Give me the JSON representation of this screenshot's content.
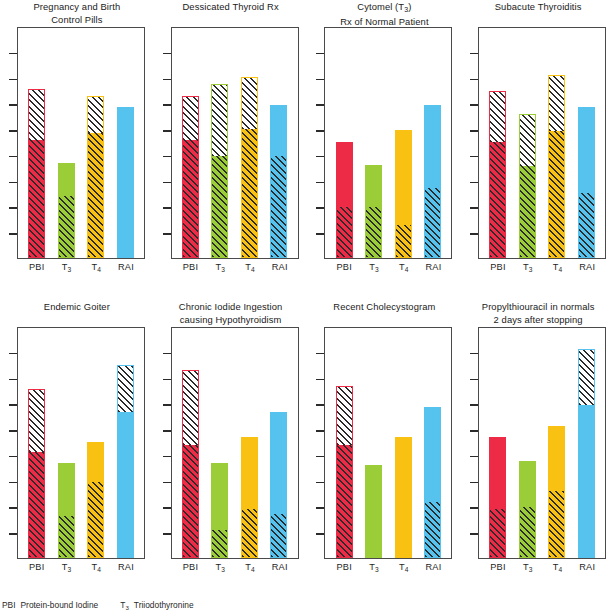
{
  "figure": {
    "axis": {
      "tick_count": 8,
      "categories": [
        "PBI",
        "T3",
        "T4",
        "RAI"
      ],
      "category_labels_html": [
        "PBI",
        "T<sub>3</sub>",
        "T<sub>4</sub>",
        "RAI"
      ]
    },
    "colors": {
      "pbi": "#ee2b46",
      "t3": "#9acd38",
      "t4": "#f9c212",
      "rai": "#56c3ee",
      "frame": "#4a4a4a",
      "hatch": "#2b2b2b",
      "title": "#1a1a1a"
    },
    "legend": [
      {
        "abbr": "PBI",
        "abbr_html": "PBI",
        "text": "Protein-bound Iodine"
      },
      {
        "abbr": "T3",
        "abbr_html": "T<sub>3</sub>",
        "text": "Triiodothyronine"
      }
    ]
  },
  "chart_data": {
    "type": "bar",
    "xlabel": "",
    "ylabel": "",
    "grid": false,
    "legend_position": "bottom",
    "categories": [
      "PBI",
      "T3",
      "T4",
      "RAI"
    ],
    "ylim": [
      0,
      100
    ],
    "panels": [
      {
        "id": "pregnancy-and-birth-control-pills",
        "title_lines": [
          "Pregnancy and Birth",
          "Control Pills"
        ],
        "bars": [
          {
            "category": "PBI",
            "color": "#ee2b46",
            "total": 73,
            "solid_top": 51,
            "hatch_from": 51
          },
          {
            "category": "T3",
            "color": "#9acd38",
            "total": 41,
            "solid_top": 41,
            "hatch_from": 27
          },
          {
            "category": "T4",
            "color": "#f9c212",
            "total": 70,
            "solid_top": 54,
            "hatch_from": 54
          },
          {
            "category": "RAI",
            "color": "#56c3ee",
            "total": 65,
            "solid_top": 65,
            "hatch_from": 0
          }
        ]
      },
      {
        "id": "dessicated-thyroid-rx",
        "title_lines": [
          "Dessicated Thyroid Rx"
        ],
        "bars": [
          {
            "category": "PBI",
            "color": "#ee2b46",
            "total": 70,
            "solid_top": 51,
            "hatch_from": 51
          },
          {
            "category": "T3",
            "color": "#9acd38",
            "total": 75,
            "solid_top": 44,
            "hatch_from": 44
          },
          {
            "category": "T4",
            "color": "#f9c212",
            "total": 78,
            "solid_top": 56,
            "hatch_from": 56
          },
          {
            "category": "RAI",
            "color": "#56c3ee",
            "total": 66,
            "solid_top": 66,
            "hatch_from": 44
          }
        ]
      },
      {
        "id": "cytomel-t3-rx-of-normal-patient",
        "title_lines": [
          "Cytomel (T3)",
          "Rx of Normal Patient"
        ],
        "title_html": [
          "Cytomel (T<sub>3</sub>)",
          "Rx of Normal Patient"
        ],
        "bars": [
          {
            "category": "PBI",
            "color": "#ee2b46",
            "total": 50,
            "solid_top": 50,
            "hatch_from": 22
          },
          {
            "category": "T3",
            "color": "#9acd38",
            "total": 40,
            "solid_top": 40,
            "hatch_from": 22
          },
          {
            "category": "T4",
            "color": "#f9c212",
            "total": 55,
            "solid_top": 55,
            "hatch_from": 14
          },
          {
            "category": "RAI",
            "color": "#56c3ee",
            "total": 66,
            "solid_top": 66,
            "hatch_from": 30
          }
        ]
      },
      {
        "id": "subacute-thyroiditis",
        "title_lines": [
          "Subacute Thyroiditis"
        ],
        "bars": [
          {
            "category": "PBI",
            "color": "#ee2b46",
            "total": 72,
            "solid_top": 50,
            "hatch_from": 50
          },
          {
            "category": "T3",
            "color": "#9acd38",
            "total": 62,
            "solid_top": 40,
            "hatch_from": 40
          },
          {
            "category": "T4",
            "color": "#f9c212",
            "total": 79,
            "solid_top": 55,
            "hatch_from": 55
          },
          {
            "category": "RAI",
            "color": "#56c3ee",
            "total": 65,
            "solid_top": 65,
            "hatch_from": 28
          }
        ]
      },
      {
        "id": "endemic-goiter",
        "title_lines": [
          "Endemic Goiter"
        ],
        "bars": [
          {
            "category": "PBI",
            "color": "#ee2b46",
            "total": 73,
            "solid_top": 46,
            "hatch_from": 46
          },
          {
            "category": "T3",
            "color": "#9acd38",
            "total": 41,
            "solid_top": 41,
            "hatch_from": 18
          },
          {
            "category": "T4",
            "color": "#f9c212",
            "total": 50,
            "solid_top": 50,
            "hatch_from": 33
          },
          {
            "category": "RAI",
            "color": "#56c3ee",
            "total": 83,
            "solid_top": 63,
            "hatch_from": 0
          }
        ]
      },
      {
        "id": "chronic-iodide-ingestion-causing-hypothyroidism",
        "title_lines": [
          "Chronic Iodide Ingestion",
          "causing Hypothyroidism"
        ],
        "bars": [
          {
            "category": "PBI",
            "color": "#ee2b46",
            "total": 81,
            "solid_top": 49,
            "hatch_from": 49
          },
          {
            "category": "T3",
            "color": "#9acd38",
            "total": 41,
            "solid_top": 41,
            "hatch_from": 12
          },
          {
            "category": "T4",
            "color": "#f9c212",
            "total": 52,
            "solid_top": 52,
            "hatch_from": 21
          },
          {
            "category": "RAI",
            "color": "#56c3ee",
            "total": 63,
            "solid_top": 63,
            "hatch_from": 19
          }
        ]
      },
      {
        "id": "recent-cholecystogram",
        "title_lines": [
          "Recent Cholecystogram"
        ],
        "bars": [
          {
            "category": "PBI",
            "color": "#ee2b46",
            "total": 74,
            "solid_top": 49,
            "hatch_from": 49
          },
          {
            "category": "T3",
            "color": "#9acd38",
            "total": 40,
            "solid_top": 40,
            "hatch_from": 0
          },
          {
            "category": "T4",
            "color": "#f9c212",
            "total": 52,
            "solid_top": 52,
            "hatch_from": 0
          },
          {
            "category": "RAI",
            "color": "#56c3ee",
            "total": 65,
            "solid_top": 65,
            "hatch_from": 24
          }
        ]
      },
      {
        "id": "propylthiouracil-in-normals-2-days-after-stopping",
        "title_lines": [
          "Propylthiouracil in normals",
          "2 days after stopping"
        ],
        "bars": [
          {
            "category": "PBI",
            "color": "#ee2b46",
            "total": 52,
            "solid_top": 52,
            "hatch_from": 21
          },
          {
            "category": "T3",
            "color": "#9acd38",
            "total": 42,
            "solid_top": 42,
            "hatch_from": 22
          },
          {
            "category": "T4",
            "color": "#f9c212",
            "total": 57,
            "solid_top": 57,
            "hatch_from": 29
          },
          {
            "category": "RAI",
            "color": "#56c3ee",
            "total": 90,
            "solid_top": 66,
            "hatch_from": 0
          }
        ]
      }
    ]
  }
}
